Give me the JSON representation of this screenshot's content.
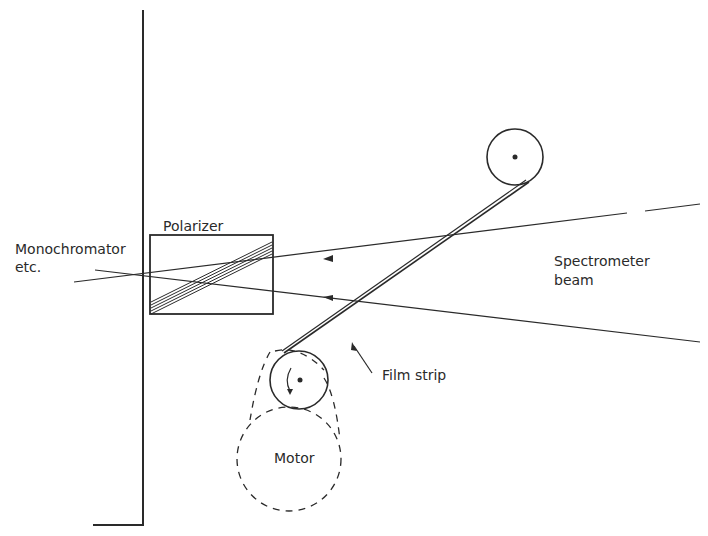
{
  "diagram": {
    "labels": {
      "polarizer": "Polarizer",
      "monochromator_line1": "Monochromator",
      "monochromator_line2": "etc.",
      "spectrometer_line1": "Spectrometer",
      "spectrometer_line2": "beam",
      "film_strip": "Film strip",
      "motor": "Motor"
    },
    "colors": {
      "ink": "#2a2a2a",
      "background": "#ffffff"
    }
  }
}
